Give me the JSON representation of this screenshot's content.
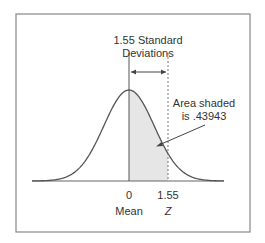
{
  "chart_data": {
    "type": "area",
    "title": "1.55 Standard Deviations",
    "title_lines": [
      "1.55 Standard",
      "Deviations"
    ],
    "x_ticks": [
      {
        "value": 0,
        "label": "0",
        "sublabel": "Mean"
      },
      {
        "value": 1.55,
        "label": "1.55",
        "sublabel": "Z"
      }
    ],
    "shaded_region": {
      "from": 0,
      "to": 1.55,
      "area": 0.43943
    },
    "annotation_lines": [
      "Area shaded",
      "is .43943"
    ],
    "distribution": "standard normal",
    "grid": false,
    "legend": null,
    "colors": {
      "curve": "#555555",
      "shade": "#e6e6e6",
      "border": "#888888",
      "text": "#333333"
    }
  },
  "labels": {
    "title1": "1.55 Standard",
    "title2": "Deviations",
    "anno1": "Area shaded",
    "anno2": "is .43943",
    "tick0": "0",
    "tick1": "1.55",
    "sub0": "Mean",
    "sub1": "Z"
  }
}
